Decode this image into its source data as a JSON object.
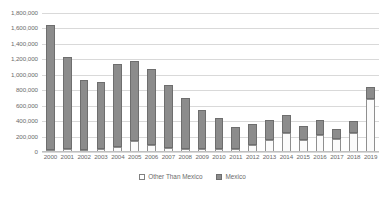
{
  "chart_data": {
    "type": "bar",
    "stacked": true,
    "title": "",
    "subtitle": "",
    "xlabel": "",
    "ylabel": "",
    "ylim": [
      0,
      1800000
    ],
    "ytick_step": 200000,
    "grid": true,
    "legend_position": "bottom",
    "categories": [
      "2000",
      "2001",
      "2002",
      "2003",
      "2004",
      "2005",
      "2006",
      "2007",
      "2008",
      "2009",
      "2010",
      "2011",
      "2012",
      "2013",
      "2014",
      "2015",
      "2016",
      "2017",
      "2018",
      "2019"
    ],
    "ytick_labels": [
      "0",
      "200,000",
      "400,000",
      "600,000",
      "800,000",
      "1,000,000",
      "1,200,000",
      "1,400,000",
      "1,600,000",
      "1,800,000"
    ],
    "ytick_values": [
      0,
      200000,
      400000,
      600000,
      800000,
      1000000,
      1200000,
      1400000,
      1600000,
      1800000
    ],
    "series": [
      {
        "name": "Other Than Mexico",
        "color": "#FFFFFF",
        "border_color": "#8F8F8F",
        "values": [
          28000,
          35000,
          30000,
          35000,
          65000,
          145000,
          90000,
          50000,
          40000,
          35000,
          40000,
          45000,
          95000,
          150000,
          250000,
          150000,
          225000,
          170000,
          245000,
          690000
        ]
      },
      {
        "name": "Mexico",
        "color": "#8C8C8C",
        "border_color": "#6E6E6E",
        "values": [
          1615000,
          1200000,
          900000,
          875000,
          1080000,
          1030000,
          985000,
          815000,
          665000,
          505000,
          405000,
          285000,
          265000,
          265000,
          230000,
          190000,
          190000,
          130000,
          155000,
          155000
        ]
      }
    ],
    "totals": [
      1643000,
      1235000,
      930000,
      910000,
      1145000,
      1175000,
      1075000,
      865000,
      705000,
      540000,
      445000,
      330000,
      360000,
      415000,
      480000,
      340000,
      415000,
      300000,
      400000,
      845000
    ]
  },
  "legend": {
    "items": [
      {
        "label": "Other Than Mexico",
        "swatch": "hollow-square"
      },
      {
        "label": "Mexico",
        "swatch": "filled-square"
      }
    ]
  },
  "colors": {
    "mexico": "#8C8C8C",
    "other_than_mexico": "#FFFFFF",
    "gridline": "#D9D9D9",
    "axis": "#BFBFBF",
    "text": "#6B6B6B",
    "background": "#FFFFFF"
  }
}
